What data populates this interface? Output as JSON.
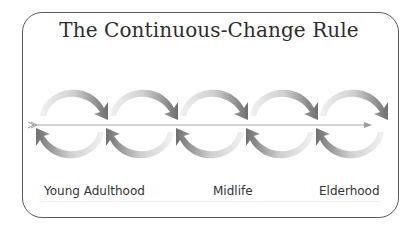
{
  "title": "The Continuous-Change Rule",
  "diagram": {
    "loop_count": 5,
    "axis_direction": "left-to-right",
    "colors": {
      "frame": "#5a5a5a",
      "arrow_dark": "#7a7a7a",
      "arrow_light": "#e6e6e6",
      "axis": "#a0a0a0"
    }
  },
  "stages": [
    {
      "label": "Young Adulthood"
    },
    {
      "label": "Midlife"
    },
    {
      "label": "Elderhood"
    }
  ]
}
